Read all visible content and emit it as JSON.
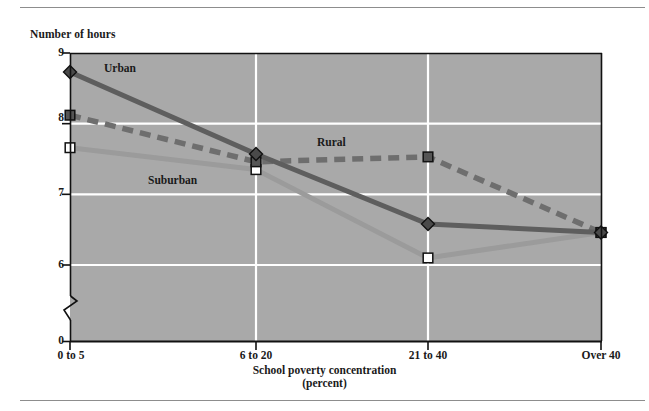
{
  "figure": {
    "ylabel": "Number of hours",
    "xlabel_line1": "School poverty concentration",
    "xlabel_line2": "(percent)"
  },
  "chart_data": {
    "type": "line",
    "title": "",
    "subtitle": "",
    "xlabel": "School poverty concentration (percent)",
    "ylabel": "Number of hours",
    "categories": [
      "0 to 5",
      "6 to 20",
      "21 to 40",
      "Over 40"
    ],
    "ytick_labels": [
      "0",
      "6",
      "7",
      "8",
      "9"
    ],
    "yticks": [
      0,
      6,
      7,
      8,
      9
    ],
    "ylim": [
      5.72,
      9
    ],
    "axis_break": true,
    "grid": "horizontal-and-vertical",
    "grid_color": "#ffffff",
    "plot_background": "#a9a9a9",
    "legend_position": "inline-annotations",
    "series": [
      {
        "name": "Urban",
        "label": "Urban",
        "color": "#5e5e5e",
        "marker": "diamond-filled",
        "linestyle": "solid",
        "values": [
          8.73,
          7.57,
          6.58,
          6.46
        ]
      },
      {
        "name": "Rural",
        "label": "Rural",
        "color": "#6e6e6e",
        "marker": "square-filled",
        "linestyle": "dashed",
        "values": [
          8.12,
          7.46,
          7.53,
          6.46
        ]
      },
      {
        "name": "Suburban",
        "label": "Suburban",
        "color": "#9b9b9b",
        "marker": "square-open",
        "linestyle": "solid",
        "values": [
          7.66,
          7.35,
          6.1,
          6.46
        ]
      }
    ],
    "annotations": [
      {
        "text": "Urban",
        "x_px": 104,
        "y_px": 62
      },
      {
        "text": "Rural",
        "x_px": 317,
        "y_px": 136
      },
      {
        "text": "Suburban",
        "x_px": 148,
        "y_px": 174
      }
    ]
  }
}
